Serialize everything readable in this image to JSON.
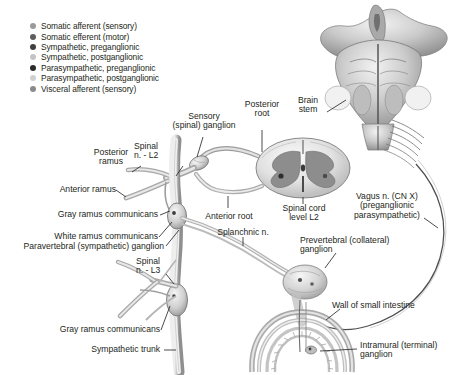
{
  "figure": {
    "width": 463,
    "height": 375,
    "background": "#ffffff"
  },
  "legend": {
    "items": [
      {
        "label": "Somatic afferent (sensory)",
        "color": "#9a9a9a"
      },
      {
        "label": "Somatic efferent (motor)",
        "color": "#5d5d5d"
      },
      {
        "label": "Sympathetic, preganglionic",
        "color": "#3f3f3f"
      },
      {
        "label": "Sympathetic, postganglionic",
        "color": "#c4c4c4"
      },
      {
        "label": "Parasympathetic, preganglionic",
        "color": "#2b2b2b"
      },
      {
        "label": "Parasympathetic, postganglionic",
        "color": "#d0d0d0"
      },
      {
        "label": "Visceral afferent (sensory)",
        "color": "#8a8a8a"
      }
    ]
  },
  "labels": {
    "sensory_ganglion": "Sensory\n(spinal) ganglion",
    "posterior_root": "Posterior\nroot",
    "brain_stem": "Brain\nstem",
    "spinal_n_l2": "Spinal\nn. - L2",
    "posterior_ramus": "Posterior\nramus",
    "anterior_ramus": "Anterior ramus",
    "gray_ramus_communicans_upper": "Gray ramus communicans",
    "white_ramus_communicans": "White ramus communicans",
    "paravertebral_ganglion": "Paravertebral (sympathetic) ganglion",
    "anterior_root": "Anterior root",
    "spinal_cord_level": "Spinal cord\nlevel L2",
    "splanchnic_n": "Splanchnic n.",
    "vagus_nerve": "Vagus n. (CN X)\n(preganglionic\nparasympathetic)",
    "prevertebral_ganglion": "Prevertebral (collateral)\nganglion",
    "spinal_n_l3": "Spinal\nn. - L3",
    "gray_ramus_communicans_lower": "Gray ramus communicans",
    "sympathetic_trunk": "Sympathetic trunk",
    "wall_of_small_intestine": "Wall of small intestine",
    "intramural_ganglion": "Intramural (terminal)\nganglion"
  }
}
